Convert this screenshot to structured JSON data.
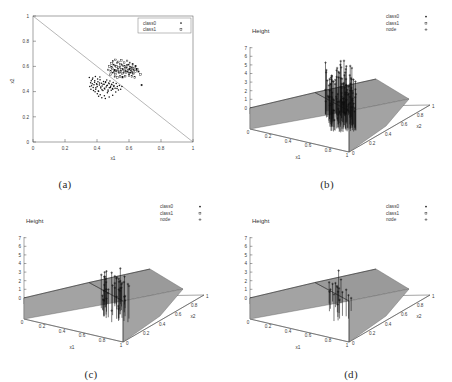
{
  "figure": {
    "panels": [
      {
        "id": "a",
        "caption": "(a)"
      },
      {
        "id": "b",
        "caption": "(b)"
      },
      {
        "id": "c",
        "caption": "(c)"
      },
      {
        "id": "d",
        "caption": "(d)"
      }
    ]
  },
  "chart_data": [
    {
      "panel": "a",
      "type": "scatter",
      "title": "",
      "xlabel": "x1",
      "ylabel": "x2",
      "xlim": [
        0,
        1
      ],
      "ylim": [
        0,
        1
      ],
      "xticks": [
        "0",
        "0.2",
        "0.4",
        "0.6",
        "0.8",
        "1"
      ],
      "yticks": [
        "0",
        "0.2",
        "0.4",
        "0.6",
        "0.8",
        "1"
      ],
      "grid": false,
      "legend_position": "top-right",
      "legend": [
        {
          "name": "class0",
          "marker": "dot"
        },
        {
          "name": "class1",
          "marker": "square"
        }
      ],
      "annotations": [
        {
          "type": "line",
          "label": "decision boundary x1+x2=1",
          "from": [
            0,
            1
          ],
          "to": [
            1,
            0
          ]
        }
      ],
      "series": [
        {
          "name": "class0",
          "marker": "dot",
          "points": [
            [
              0.352,
              0.512
            ],
            [
              0.36,
              0.47
            ],
            [
              0.366,
              0.447
            ],
            [
              0.371,
              0.498
            ],
            [
              0.376,
              0.432
            ],
            [
              0.381,
              0.455
            ],
            [
              0.386,
              0.487
            ],
            [
              0.392,
              0.419
            ],
            [
              0.397,
              0.463
            ],
            [
              0.401,
              0.441
            ],
            [
              0.406,
              0.479
            ],
            [
              0.41,
              0.403
            ],
            [
              0.415,
              0.452
            ],
            [
              0.419,
              0.494
            ],
            [
              0.424,
              0.428
            ],
            [
              0.428,
              0.466
            ],
            [
              0.432,
              0.445
            ],
            [
              0.437,
              0.408
            ],
            [
              0.441,
              0.481
            ],
            [
              0.445,
              0.459
            ],
            [
              0.449,
              0.421
            ],
            [
              0.453,
              0.472
            ],
            [
              0.457,
              0.436
            ],
            [
              0.461,
              0.492
            ],
            [
              0.465,
              0.45
            ],
            [
              0.469,
              0.412
            ],
            [
              0.473,
              0.468
            ],
            [
              0.477,
              0.43
            ],
            [
              0.481,
              0.484
            ],
            [
              0.485,
              0.443
            ],
            [
              0.388,
              0.398
            ],
            [
              0.402,
              0.382
            ],
            [
              0.42,
              0.375
            ],
            [
              0.446,
              0.368
            ],
            [
              0.465,
              0.39
            ],
            [
              0.489,
              0.41
            ],
            [
              0.493,
              0.455
            ],
            [
              0.497,
              0.425
            ],
            [
              0.501,
              0.472
            ],
            [
              0.505,
              0.44
            ],
            [
              0.355,
              0.44
            ],
            [
              0.362,
              0.418
            ],
            [
              0.37,
              0.462
            ],
            [
              0.378,
              0.408
            ],
            [
              0.385,
              0.475
            ],
            [
              0.393,
              0.43
            ],
            [
              0.4,
              0.456
            ],
            [
              0.408,
              0.404
            ],
            [
              0.416,
              0.468
            ],
            [
              0.423,
              0.436
            ],
            [
              0.431,
              0.414
            ],
            [
              0.438,
              0.459
            ],
            [
              0.446,
              0.426
            ],
            [
              0.454,
              0.478
            ],
            [
              0.461,
              0.447
            ],
            [
              0.469,
              0.402
            ],
            [
              0.476,
              0.463
            ],
            [
              0.484,
              0.433
            ],
            [
              0.491,
              0.458
            ],
            [
              0.499,
              0.419
            ],
            [
              0.506,
              0.449
            ],
            [
              0.513,
              0.427
            ],
            [
              0.52,
              0.465
            ],
            [
              0.527,
              0.44
            ],
            [
              0.534,
              0.412
            ],
            [
              0.43,
              0.352
            ],
            [
              0.452,
              0.345
            ],
            [
              0.476,
              0.358
            ],
            [
              0.41,
              0.364
            ],
            [
              0.498,
              0.372
            ],
            [
              0.517,
              0.397
            ],
            [
              0.525,
              0.424
            ],
            [
              0.54,
              0.448
            ],
            [
              0.548,
              0.418
            ],
            [
              0.556,
              0.44
            ],
            [
              0.364,
              0.486
            ],
            [
              0.374,
              0.508
            ],
            [
              0.39,
              0.52
            ],
            [
              0.404,
              0.5
            ],
            [
              0.418,
              0.516
            ]
          ]
        },
        {
          "name": "class1",
          "marker": "square",
          "points": [
            [
              0.486,
              0.56
            ],
            [
              0.492,
              0.592
            ],
            [
              0.498,
              0.548
            ],
            [
              0.504,
              0.612
            ],
            [
              0.51,
              0.57
            ],
            [
              0.516,
              0.538
            ],
            [
              0.522,
              0.6
            ],
            [
              0.528,
              0.562
            ],
            [
              0.534,
              0.59
            ],
            [
              0.54,
              0.548
            ],
            [
              0.546,
              0.618
            ],
            [
              0.552,
              0.575
            ],
            [
              0.558,
              0.542
            ],
            [
              0.564,
              0.604
            ],
            [
              0.57,
              0.566
            ],
            [
              0.576,
              0.588
            ],
            [
              0.582,
              0.552
            ],
            [
              0.588,
              0.61
            ],
            [
              0.594,
              0.572
            ],
            [
              0.6,
              0.545
            ],
            [
              0.606,
              0.596
            ],
            [
              0.612,
              0.56
            ],
            [
              0.618,
              0.584
            ],
            [
              0.624,
              0.55
            ],
            [
              0.63,
              0.572
            ],
            [
              0.5,
              0.64
            ],
            [
              0.516,
              0.652
            ],
            [
              0.534,
              0.636
            ],
            [
              0.552,
              0.648
            ],
            [
              0.57,
              0.63
            ],
            [
              0.588,
              0.644
            ],
            [
              0.606,
              0.628
            ],
            [
              0.624,
              0.616
            ],
            [
              0.642,
              0.602
            ],
            [
              0.648,
              0.578
            ],
            [
              0.47,
              0.572
            ],
            [
              0.478,
              0.6
            ],
            [
              0.484,
              0.534
            ],
            [
              0.49,
              0.624
            ],
            [
              0.496,
              0.582
            ],
            [
              0.508,
              0.556
            ],
            [
              0.514,
              0.604
            ],
            [
              0.52,
              0.566
            ],
            [
              0.526,
              0.628
            ],
            [
              0.532,
              0.58
            ],
            [
              0.538,
              0.558
            ],
            [
              0.544,
              0.596
            ],
            [
              0.55,
              0.56
            ],
            [
              0.556,
              0.612
            ],
            [
              0.562,
              0.578
            ],
            [
              0.568,
              0.548
            ],
            [
              0.574,
              0.6
            ],
            [
              0.58,
              0.566
            ],
            [
              0.586,
              0.59
            ],
            [
              0.592,
              0.556
            ],
            [
              0.598,
              0.612
            ],
            [
              0.604,
              0.578
            ],
            [
              0.61,
              0.548
            ],
            [
              0.616,
              0.592
            ],
            [
              0.622,
              0.566
            ],
            [
              0.628,
              0.54
            ],
            [
              0.634,
              0.588
            ],
            [
              0.64,
              0.56
            ],
            [
              0.652,
              0.576
            ],
            [
              0.66,
              0.558
            ],
            [
              0.672,
              0.535
            ],
            [
              0.68,
              0.452
            ],
            [
              0.576,
              0.522
            ],
            [
              0.56,
              0.514
            ],
            [
              0.544,
              0.52
            ],
            [
              0.528,
              0.512
            ],
            [
              0.512,
              0.518
            ],
            [
              0.6,
              0.528
            ],
            [
              0.618,
              0.52
            ],
            [
              0.636,
              0.512
            ]
          ]
        }
      ]
    },
    {
      "panel": "b",
      "type": "surface3d",
      "title": "",
      "xlabel": "x1",
      "ylabel": "x2",
      "zlabel": "Height",
      "xlim": [
        0,
        1
      ],
      "ylim": [
        0,
        1
      ],
      "zlim": [
        0,
        7
      ],
      "xticks": [
        "0",
        "0.2",
        "0.4",
        "0.6",
        "0.8",
        "1"
      ],
      "yticks": [
        "0",
        "0.2",
        "0.4",
        "0.6",
        "0.8",
        "1"
      ],
      "zticks": [
        "0",
        "1",
        "2",
        "3",
        "4",
        "5",
        "6",
        "7"
      ],
      "grid": false,
      "legend_position": "top-right",
      "legend": [
        {
          "name": "class0",
          "marker": "dot"
        },
        {
          "name": "class1",
          "marker": "square"
        },
        {
          "name": "node",
          "marker": "plus"
        }
      ],
      "node_count": 120,
      "node_height_range": [
        2.0,
        7.0
      ],
      "surface_description": "ridge / tent surface peaking along the x1+x2=1 diagonal"
    },
    {
      "panel": "c",
      "type": "surface3d",
      "title": "",
      "xlabel": "x1",
      "ylabel": "x2",
      "zlabel": "Height",
      "xlim": [
        0,
        1
      ],
      "ylim": [
        0,
        1
      ],
      "zlim": [
        0,
        7
      ],
      "xticks": [
        "0",
        "0.2",
        "0.4",
        "0.6",
        "0.8",
        "1"
      ],
      "yticks": [
        "0",
        "0.2",
        "0.4",
        "0.6",
        "0.8",
        "1"
      ],
      "zticks": [
        "0",
        "1",
        "2",
        "3",
        "4",
        "5",
        "6",
        "7"
      ],
      "grid": false,
      "legend_position": "top-right",
      "legend": [
        {
          "name": "class0",
          "marker": "dot"
        },
        {
          "name": "class1",
          "marker": "square"
        },
        {
          "name": "node",
          "marker": "plus"
        }
      ],
      "node_count": 45,
      "node_height_range": [
        2.0,
        5.5
      ],
      "surface_description": "ridge / tent surface peaking along the x1+x2=1 diagonal"
    },
    {
      "panel": "d",
      "type": "surface3d",
      "title": "",
      "xlabel": "x1",
      "ylabel": "x2",
      "zlabel": "Height",
      "xlim": [
        0,
        1
      ],
      "ylim": [
        0,
        1
      ],
      "zlim": [
        0,
        7
      ],
      "xticks": [
        "0",
        "0.2",
        "0.4",
        "0.6",
        "0.8",
        "1"
      ],
      "yticks": [
        "0",
        "0.2",
        "0.4",
        "0.6",
        "0.8",
        "1"
      ],
      "zticks": [
        "0",
        "1",
        "2",
        "3",
        "4",
        "5",
        "6",
        "7"
      ],
      "grid": false,
      "legend_position": "top-right",
      "legend": [
        {
          "name": "class0",
          "marker": "dot"
        },
        {
          "name": "class1",
          "marker": "square"
        },
        {
          "name": "node",
          "marker": "plus"
        }
      ],
      "node_count": 18,
      "node_height_range": [
        2.0,
        4.5
      ],
      "surface_description": "ridge / tent surface peaking along the x1+x2=1 diagonal"
    }
  ],
  "colors": {
    "background": "#ffffff",
    "axis": "#4a4a4a",
    "surface": "#a3a3a3",
    "marker": "#111111",
    "text": "#2a2a2a"
  }
}
